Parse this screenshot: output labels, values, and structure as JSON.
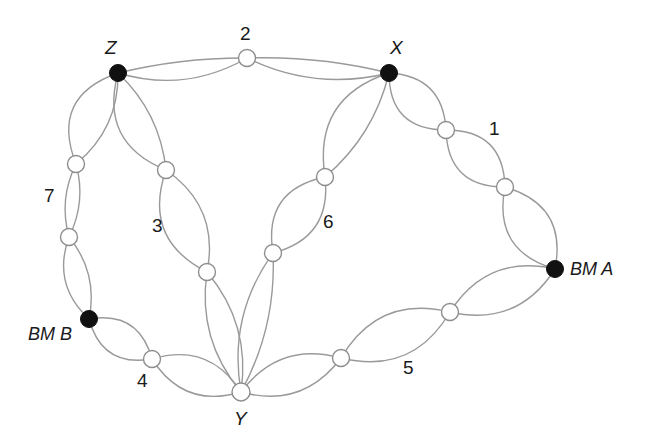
{
  "diagram": {
    "type": "node-link-diagram",
    "width": 655,
    "height": 441,
    "background_color": "#ffffff",
    "edge_color": "#9a9a9a",
    "filled_node_color": "#111111",
    "open_node_fill": "#ffffff",
    "open_node_stroke": "#8e8e8e"
  },
  "nodes": [
    {
      "id": "Z",
      "label": "Z",
      "kind": "filled",
      "x": 118,
      "y": 73,
      "r": 8.5,
      "label_x": 105,
      "label_y": 38,
      "label_style": "node"
    },
    {
      "id": "X",
      "label": "X",
      "kind": "filled",
      "x": 389,
      "y": 73,
      "r": 8.5,
      "label_x": 390,
      "label_y": 38,
      "label_style": "node"
    },
    {
      "id": "BMA",
      "label": "BM A",
      "kind": "filled",
      "x": 555,
      "y": 269,
      "r": 8.5,
      "label_x": 570,
      "label_y": 260,
      "label_style": "bm"
    },
    {
      "id": "BMB",
      "label": "BM B",
      "kind": "filled",
      "x": 89,
      "y": 319,
      "r": 8.5,
      "label_x": 28,
      "label_y": 325,
      "label_style": "bm"
    },
    {
      "id": "Y",
      "label": "Y",
      "kind": "open",
      "x": 241,
      "y": 392,
      "r": 9.0,
      "label_x": 234,
      "label_y": 409,
      "label_style": "node"
    },
    {
      "id": "n2",
      "label": "2",
      "kind": "open",
      "x": 247,
      "y": 58,
      "r": 8.5,
      "label_x": 240,
      "label_y": 24,
      "label_style": "num"
    },
    {
      "id": "n1a",
      "label": "",
      "kind": "open",
      "x": 446,
      "y": 130,
      "r": 8.5,
      "label_x": 0,
      "label_y": 0,
      "label_style": "none"
    },
    {
      "id": "n1b",
      "label": "1",
      "kind": "open",
      "x": 505,
      "y": 187,
      "r": 8.5,
      "label_x": 489,
      "label_y": 119,
      "label_style": "num"
    },
    {
      "id": "n6a",
      "label": "",
      "kind": "open",
      "x": 325,
      "y": 177,
      "r": 8.5,
      "label_x": 0,
      "label_y": 0,
      "label_style": "none"
    },
    {
      "id": "n6b",
      "label": "6",
      "kind": "open",
      "x": 273,
      "y": 253,
      "r": 8.5,
      "label_x": 323,
      "label_y": 212,
      "label_style": "num"
    },
    {
      "id": "n3a",
      "label": "",
      "kind": "open",
      "x": 166,
      "y": 170,
      "r": 8.5,
      "label_x": 0,
      "label_y": 0,
      "label_style": "none"
    },
    {
      "id": "n3b",
      "label": "3",
      "kind": "open",
      "x": 207,
      "y": 272,
      "r": 8.5,
      "label_x": 152,
      "label_y": 216,
      "label_style": "num"
    },
    {
      "id": "n7a",
      "label": "",
      "kind": "open",
      "x": 76,
      "y": 164,
      "r": 8.5,
      "label_x": 0,
      "label_y": 0,
      "label_style": "none"
    },
    {
      "id": "n7b",
      "label": "7",
      "kind": "open",
      "x": 69,
      "y": 237,
      "r": 8.5,
      "label_x": 44,
      "label_y": 186,
      "label_style": "num"
    },
    {
      "id": "n4",
      "label": "4",
      "kind": "open",
      "x": 152,
      "y": 359,
      "r": 8.5,
      "label_x": 137,
      "label_y": 371,
      "label_style": "num"
    },
    {
      "id": "n5a",
      "label": "5",
      "kind": "open",
      "x": 341,
      "y": 358,
      "r": 8.5,
      "label_x": 403,
      "label_y": 358,
      "label_style": "num"
    },
    {
      "id": "n5b",
      "label": "",
      "kind": "open",
      "x": 450,
      "y": 312,
      "r": 8.5,
      "label_x": 0,
      "label_y": 0,
      "label_style": "none"
    }
  ],
  "edges": [
    {
      "from": "Z",
      "to": "n2",
      "bow": 14,
      "link": "2"
    },
    {
      "from": "Z",
      "to": "n2",
      "bow": -4,
      "link": "2"
    },
    {
      "from": "n2",
      "to": "X",
      "bow": 13,
      "link": "2"
    },
    {
      "from": "n2",
      "to": "X",
      "bow": -5,
      "link": "2"
    },
    {
      "from": "X",
      "to": "n1a",
      "bow": 20,
      "link": "1"
    },
    {
      "from": "X",
      "to": "n1a",
      "bow": -18,
      "link": "1"
    },
    {
      "from": "n1a",
      "to": "n1b",
      "bow": 20,
      "link": "1"
    },
    {
      "from": "n1a",
      "to": "n1b",
      "bow": -20,
      "link": "1"
    },
    {
      "from": "n1b",
      "to": "BMA",
      "bow": 22,
      "link": "1"
    },
    {
      "from": "n1b",
      "to": "BMA",
      "bow": -22,
      "link": "1"
    },
    {
      "from": "X",
      "to": "n6a",
      "bow": 26,
      "link": "6"
    },
    {
      "from": "X",
      "to": "n6a",
      "bow": -10,
      "link": "6"
    },
    {
      "from": "n6a",
      "to": "n6b",
      "bow": 22,
      "link": "6"
    },
    {
      "from": "n6a",
      "to": "n6b",
      "bow": -20,
      "link": "6"
    },
    {
      "from": "n6b",
      "to": "Y",
      "bow": 15,
      "link": "6"
    },
    {
      "from": "n6b",
      "to": "Y",
      "bow": -10,
      "link": "6"
    },
    {
      "from": "Z",
      "to": "n3a",
      "bow": 24,
      "link": "3"
    },
    {
      "from": "Z",
      "to": "n3a",
      "bow": -10,
      "link": "3"
    },
    {
      "from": "n3a",
      "to": "n3b",
      "bow": 24,
      "link": "3"
    },
    {
      "from": "n3a",
      "to": "n3b",
      "bow": -18,
      "link": "3"
    },
    {
      "from": "n3b",
      "to": "Y",
      "bow": 14,
      "link": "3"
    },
    {
      "from": "n3b",
      "to": "Y",
      "bow": -14,
      "link": "3"
    },
    {
      "from": "Z",
      "to": "n7a",
      "bow": 26,
      "link": "7"
    },
    {
      "from": "Z",
      "to": "n7a",
      "bow": -12,
      "link": "7"
    },
    {
      "from": "n7a",
      "to": "n7b",
      "bow": 7,
      "link": "7"
    },
    {
      "from": "n7a",
      "to": "n7b",
      "bow": -7,
      "link": "7"
    },
    {
      "from": "n7b",
      "to": "BMB",
      "bow": 14,
      "link": "7"
    },
    {
      "from": "n7b",
      "to": "BMB",
      "bow": -10,
      "link": "7"
    },
    {
      "from": "BMB",
      "to": "n4",
      "bow": 17,
      "link": "4"
    },
    {
      "from": "BMB",
      "to": "n4",
      "bow": -17,
      "link": "4"
    },
    {
      "from": "n4",
      "to": "Y",
      "bow": 18,
      "link": "4"
    },
    {
      "from": "n4",
      "to": "Y",
      "bow": -18,
      "link": "4"
    },
    {
      "from": "Y",
      "to": "n5a",
      "bow": 18,
      "link": "5"
    },
    {
      "from": "Y",
      "to": "n5a",
      "bow": -18,
      "link": "5"
    },
    {
      "from": "n5a",
      "to": "n5b",
      "bow": 22,
      "link": "5"
    },
    {
      "from": "n5a",
      "to": "n5b",
      "bow": -22,
      "link": "5"
    },
    {
      "from": "n5b",
      "to": "BMA",
      "bow": 20,
      "link": "5"
    },
    {
      "from": "n5b",
      "to": "BMA",
      "bow": -20,
      "link": "5"
    }
  ],
  "link_labels": [
    {
      "text": "1"
    },
    {
      "text": "2"
    },
    {
      "text": "3"
    },
    {
      "text": "4"
    },
    {
      "text": "5"
    },
    {
      "text": "6"
    },
    {
      "text": "7"
    }
  ],
  "endpoint_labels": [
    {
      "text": "Z"
    },
    {
      "text": "X"
    },
    {
      "text": "Y"
    },
    {
      "text": "BM A"
    },
    {
      "text": "BM B"
    }
  ]
}
